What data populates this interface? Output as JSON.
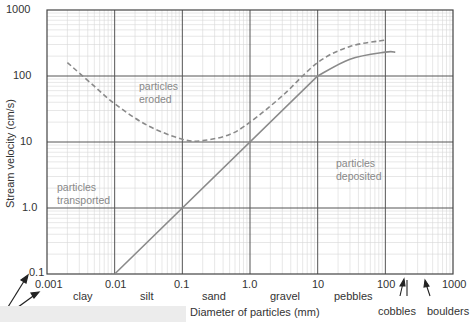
{
  "chart_data": {
    "type": "line",
    "title": "",
    "xlabel": "Diameter of particles (mm)",
    "ylabel": "Stream velocity (cm/s)",
    "xscale": "log",
    "yscale": "log",
    "xlim": [
      0.001,
      1000
    ],
    "ylim": [
      0.1,
      1000
    ],
    "grid": true,
    "x_ticks": [
      "0.001",
      "0.01",
      "0.1",
      "1.0",
      "10",
      "100",
      "1000"
    ],
    "y_ticks": [
      "0.1",
      "1.0",
      "10",
      "100",
      "1000"
    ],
    "series": [
      {
        "name": "erosion velocity (dashed)",
        "style": "dashed",
        "color": "#8a8a8a",
        "x": [
          0.002,
          0.005,
          0.01,
          0.03,
          0.1,
          0.2,
          0.5,
          1,
          3,
          10,
          30,
          100
        ],
        "y": [
          160,
          70,
          38,
          18,
          11,
          10.5,
          13,
          20,
          50,
          160,
          280,
          350
        ]
      },
      {
        "name": "settling velocity (solid)",
        "style": "solid",
        "color": "#8a8a8a",
        "x": [
          0.01,
          0.1,
          1,
          10,
          30,
          100,
          140
        ],
        "y": [
          0.1,
          1,
          10,
          100,
          180,
          230,
          230
        ]
      }
    ],
    "annotations": [
      {
        "text": "particles eroded",
        "x": 0.15,
        "y": 60
      },
      {
        "text": "particles transported",
        "x": 0.002,
        "y": 2.5
      },
      {
        "text": "particles deposited",
        "x": 18,
        "y": 5
      }
    ],
    "size_classes": [
      "clay",
      "silt",
      "sand",
      "gravel",
      "pebbles",
      "cobbles",
      "boulders"
    ]
  },
  "axes": {
    "xlabel": "Diameter of particles (mm)",
    "ylabel": "Stream velocity (cm/s)",
    "x_ticks": [
      "0.001",
      "0.01",
      "0.1",
      "1.0",
      "10",
      "100",
      "1000"
    ],
    "y_ticks": [
      "1000",
      "100",
      "10",
      "1.0",
      "0.1"
    ]
  },
  "regions": {
    "eroded": [
      "particles",
      "eroded"
    ],
    "transported": [
      "particles",
      "transported"
    ],
    "deposited": [
      "particles",
      "deposited"
    ]
  },
  "categories": {
    "clay": "clay",
    "silt": "silt",
    "sand": "sand",
    "gravel": "gravel",
    "pebbles": "pebbles",
    "cobbles": "cobbles",
    "boulders": "boulders"
  }
}
